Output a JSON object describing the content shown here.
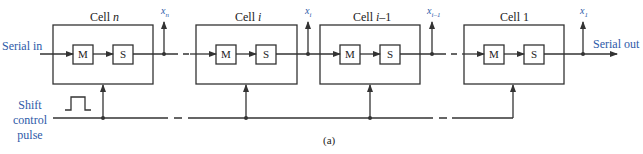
{
  "figure": {
    "caption": "(a)",
    "colors": {
      "line": "#333333",
      "label_blue": "#2e5aa8"
    },
    "inputs": {
      "serial_in": "Serial in",
      "serial_out": "Serial out"
    },
    "control": {
      "line1": "Shift",
      "line2": "control",
      "line3": "pulse"
    },
    "cells": [
      {
        "title_prefix": "Cell ",
        "title_var": "n",
        "m_label": "M",
        "s_label": "S",
        "output_var": "x",
        "output_sub": "n"
      },
      {
        "title_prefix": "Cell ",
        "title_var": "i",
        "m_label": "M",
        "s_label": "S",
        "output_var": "x",
        "output_sub": "i"
      },
      {
        "title_prefix": "Cell ",
        "title_var": "i",
        "title_suffix": "–1",
        "m_label": "M",
        "s_label": "S",
        "output_var": "x",
        "output_sub": "i–1"
      },
      {
        "title_prefix": "Cell 1",
        "title_var": "",
        "m_label": "M",
        "s_label": "S",
        "output_var": "x",
        "output_sub": "1"
      }
    ]
  }
}
